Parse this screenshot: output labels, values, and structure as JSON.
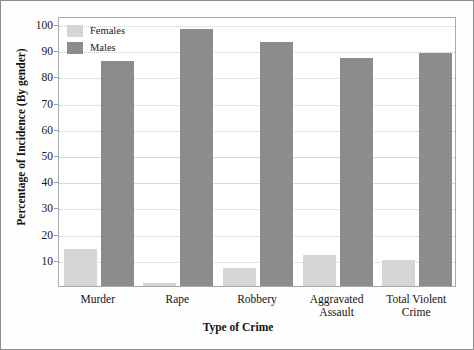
{
  "chart_data": {
    "type": "bar",
    "title": "",
    "xlabel": "Type of Crime",
    "ylabel": "Percentage of Incidence (By gender)",
    "categories": [
      "Murder",
      "Rape",
      "Robbery",
      "Aggravated\nAssault",
      "Total Violent\nCrime"
    ],
    "category_lines": [
      [
        "Murder"
      ],
      [
        "Rape"
      ],
      [
        "Robbery"
      ],
      [
        "Aggravated",
        "Assault"
      ],
      [
        "Total Violent",
        "Crime"
      ]
    ],
    "series": [
      {
        "name": "Females",
        "color": "#d5d5d5",
        "values": [
          14,
          1,
          7,
          12,
          10
        ]
      },
      {
        "name": "Males",
        "color": "#8c8c8c",
        "values": [
          86,
          98,
          93,
          87,
          89
        ]
      }
    ],
    "ylim": [
      0,
      103
    ],
    "yticks": [
      10,
      20,
      30,
      40,
      50,
      60,
      70,
      80,
      90,
      100
    ],
    "ytick_labels": [
      "10",
      "20",
      "30",
      "40",
      "50",
      "60",
      "70",
      "80",
      "90",
      "100"
    ],
    "grid": true,
    "legend_position": "top-left",
    "legend_entries": [
      "Females",
      "Males"
    ]
  }
}
